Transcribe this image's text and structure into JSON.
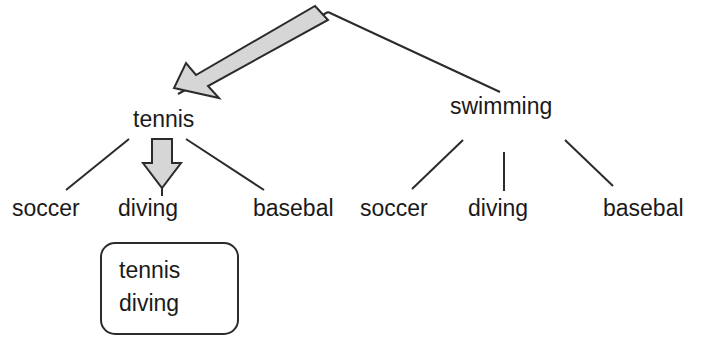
{
  "diagram": {
    "type": "decision-tree-with-annotation",
    "root": {
      "label": "",
      "vertex_x": 328,
      "vertex_y": 12
    },
    "level1": [
      {
        "label": "tennis",
        "x": 133,
        "y": 110
      },
      {
        "label": "swimming",
        "x": 450,
        "y": 97
      }
    ],
    "tennis_children": [
      {
        "label": "soccer",
        "x": 12,
        "y": 198
      },
      {
        "label": "diving",
        "x": 118,
        "y": 198
      },
      {
        "label": "basebal",
        "x": 253,
        "y": 198
      }
    ],
    "swimming_children": [
      {
        "label": "soccer",
        "x": 360,
        "y": 198
      },
      {
        "label": "diving",
        "x": 468,
        "y": 198
      },
      {
        "label": "basebal",
        "x": 603,
        "y": 198
      }
    ],
    "callout_box": {
      "line1": "tennis",
      "line2": "diving",
      "x": 101,
      "y": 243,
      "width": 137,
      "height": 91,
      "corner_radius": 14
    },
    "annotations": {
      "big_arrow": {
        "name": "large-pointer-arrow",
        "from_x": 322,
        "from_y": 10,
        "to_x": 177,
        "to_y": 88
      },
      "down_arrow": {
        "name": "down-block-arrow",
        "x": 162,
        "from_y": 139,
        "to_y": 188
      }
    }
  },
  "colors": {
    "stroke": "#2b2b2b",
    "text": "#1a1a1a",
    "arrow_fill": "#d6d6d6",
    "arrow_outline": "#2b2b2b",
    "background": "#ffffff"
  }
}
